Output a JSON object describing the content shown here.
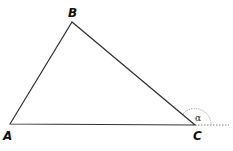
{
  "diagram": {
    "type": "triangle",
    "vertices": {
      "A": {
        "label": "A"
      },
      "B": {
        "label": "B"
      },
      "C": {
        "label": "C"
      }
    },
    "exterior_angle": {
      "vertex": "C",
      "label": "α"
    },
    "colors": {
      "stroke": "#333333",
      "dotted": "#777777"
    }
  }
}
